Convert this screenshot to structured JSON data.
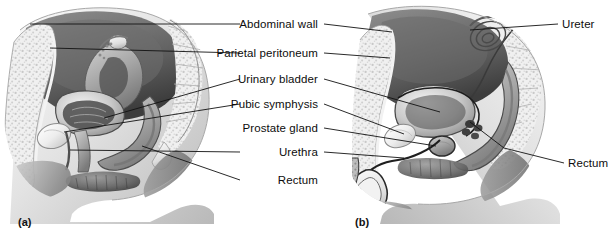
{
  "figure": {
    "background_color": "#ffffff",
    "line_color": "#1a1a1a",
    "text_color": "#0d0d0d",
    "width": 615,
    "height": 240
  },
  "panels": [
    {
      "id": "panel-a",
      "caption": "(a)",
      "subject": "female pelvis sagittal section",
      "caption_x": 18,
      "caption_y": 216
    },
    {
      "id": "panel-b",
      "caption": "(b)",
      "subject": "male pelvis sagittal section",
      "caption_x": 355,
      "caption_y": 216
    }
  ],
  "center_labels": [
    {
      "id": "abdominal-wall",
      "text": "Abdominal wall",
      "x": 318,
      "y": 18,
      "has_left_leader": true,
      "has_right_leader": true
    },
    {
      "id": "parietal-peritoneum",
      "text": "Parietal peritoneum",
      "x": 318,
      "y": 47,
      "has_left_leader": true,
      "has_right_leader": true
    },
    {
      "id": "urinary-bladder",
      "text": "Urinary bladder",
      "x": 318,
      "y": 73,
      "has_left_leader": true,
      "has_right_leader": true
    },
    {
      "id": "pubic-symphysis",
      "text": "Pubic symphysis",
      "x": 318,
      "y": 98,
      "has_left_leader": true,
      "has_right_leader": true
    },
    {
      "id": "prostate-gland",
      "text": "Prostate gland",
      "x": 318,
      "y": 122,
      "has_left_leader": false,
      "has_right_leader": true
    },
    {
      "id": "urethra",
      "text": "Urethra",
      "x": 318,
      "y": 146,
      "has_left_leader": true,
      "has_right_leader": true
    },
    {
      "id": "rectum-left",
      "text": "Rectum",
      "x": 318,
      "y": 174,
      "has_left_leader": true,
      "has_right_leader": false
    }
  ],
  "right_labels": [
    {
      "id": "ureter",
      "text": "Ureter",
      "x": 562,
      "y": 18
    },
    {
      "id": "rectum-right",
      "text": "Rectum",
      "x": 568,
      "y": 157
    }
  ]
}
